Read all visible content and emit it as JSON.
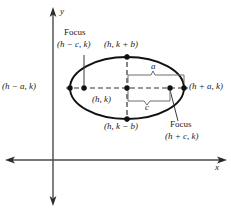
{
  "figure": {
    "axes": {
      "x_label": "x",
      "y_label": "y"
    },
    "labels": {
      "focus_left_word": "Focus",
      "focus_left_point": "(h − c, k)",
      "focus_right_word": "Focus",
      "focus_right_point": "(h + c, k)",
      "vertex_left": "(h − a, k)",
      "vertex_right": "(h + a, k)",
      "covertex_top": "(h, k + b)",
      "covertex_bottom": "(h, k − b)",
      "center": "(h, k)",
      "semi_major": "a",
      "semi_focal": "c"
    },
    "colors": {
      "stroke": "#1a1a1a",
      "axis": "#4a4a4a",
      "brace": "#6e6e6e",
      "background": "#ffffff"
    },
    "geometry": {
      "center_x": 127,
      "center_y": 88,
      "radius_x": 57,
      "radius_y": 31,
      "focus_offset": 43,
      "origin_x": 53,
      "origin_y": 160
    }
  }
}
